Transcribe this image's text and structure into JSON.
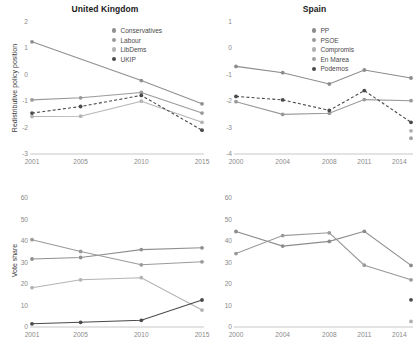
{
  "figure": {
    "panels": [
      "uk_policy",
      "spain_policy",
      "uk_vote",
      "spain_vote"
    ]
  },
  "uk_policy": {
    "title": "United Kingdom",
    "ylabel": "Redistributive policy position",
    "yticks": [
      "2",
      "1",
      "0",
      "-1",
      "-2",
      "-3"
    ],
    "xticks": [
      "2001",
      "2005",
      "2010",
      "2015"
    ],
    "legend": [
      {
        "label": "Conservatives",
        "color": "#909090"
      },
      {
        "label": "Labour",
        "color": "#9a9a9a"
      },
      {
        "label": "LibDems",
        "color": "#b4b4b4"
      },
      {
        "label": "UKIP",
        "color": "#4a4a4a"
      }
    ]
  },
  "spain_policy": {
    "title": "Spain",
    "ylabel": "",
    "yticks": [
      "1",
      "0",
      "-1",
      "-2",
      "-3",
      "-4"
    ],
    "xticks": [
      "2000",
      "2004",
      "2008",
      "2011",
      "2014"
    ],
    "legend": [
      {
        "label": "PP",
        "color": "#8c8c8c"
      },
      {
        "label": "PSOE",
        "color": "#9a9a9a"
      },
      {
        "label": "Compromis",
        "color": "#b0b0b0"
      },
      {
        "label": "En Marea",
        "color": "#a0a0a0"
      },
      {
        "label": "Podemos",
        "color": "#4a4a4a"
      }
    ]
  },
  "uk_vote": {
    "title": "",
    "ylabel": "Vote share",
    "yticks": [
      "60",
      "50",
      "40",
      "30",
      "20",
      "10",
      "0"
    ],
    "xticks": [
      "2001",
      "2005",
      "2010",
      "2015"
    ]
  },
  "spain_vote": {
    "title": "",
    "ylabel": "",
    "yticks": [
      "60",
      "50",
      "40",
      "30",
      "20",
      "10",
      "0"
    ],
    "xticks": [
      "2000",
      "2004",
      "2008",
      "2011",
      "2014"
    ]
  },
  "chart_data": [
    {
      "type": "line",
      "id": "uk_policy",
      "title": "United Kingdom",
      "xlabel": "",
      "ylabel": "Redistributive policy position",
      "x": [
        2001,
        2005,
        2010,
        2015
      ],
      "xticklabels": [
        "2001",
        "2005",
        "2010",
        "2015"
      ],
      "ylim": [
        -3,
        2
      ],
      "yticks": [
        2,
        1,
        0,
        -1,
        -2,
        -3
      ],
      "grid": false,
      "legend_position": "top-right",
      "series": [
        {
          "name": "Conservatives",
          "color": "#909090",
          "style": "solid",
          "values": [
            1.25,
            null,
            -0.22,
            -1.1
          ]
        },
        {
          "name": "Labour",
          "color": "#9a9a9a",
          "style": "solid",
          "values": [
            -0.95,
            -0.87,
            -0.67,
            -1.45
          ]
        },
        {
          "name": "LibDems",
          "color": "#b4b4b4",
          "style": "solid",
          "values": [
            -1.58,
            -1.57,
            -1.0,
            -1.8
          ]
        },
        {
          "name": "UKIP",
          "color": "#4a4a4a",
          "style": "dashed",
          "values": [
            -1.45,
            -1.2,
            -0.78,
            -2.1
          ]
        }
      ]
    },
    {
      "type": "line",
      "id": "spain_policy",
      "title": "Spain",
      "xlabel": "",
      "ylabel": "",
      "x": [
        2000,
        2004,
        2008,
        2011,
        2014,
        2015
      ],
      "xticklabels": [
        "2000",
        "2004",
        "2008",
        "2011",
        "2014"
      ],
      "ylim": [
        -4,
        1
      ],
      "yticks": [
        1,
        0,
        -1,
        -2,
        -3,
        -4
      ],
      "grid": false,
      "legend_position": "top-right",
      "series": [
        {
          "name": "PP",
          "color": "#8c8c8c",
          "style": "solid",
          "values": [
            -0.68,
            -0.92,
            -1.35,
            -0.82,
            null,
            -1.12
          ]
        },
        {
          "name": "PSOE",
          "color": "#9a9a9a",
          "style": "solid",
          "values": [
            -2.02,
            -2.5,
            -2.46,
            -1.94,
            null,
            -1.98
          ]
        },
        {
          "name": "Compromis",
          "color": "#b0b0b0",
          "style": "solid",
          "values": [
            null,
            null,
            null,
            null,
            null,
            -3.12
          ]
        },
        {
          "name": "En Marea",
          "color": "#a0a0a0",
          "style": "solid",
          "values": [
            null,
            null,
            null,
            null,
            null,
            -3.4
          ]
        },
        {
          "name": "Podemos",
          "color": "#4a4a4a",
          "style": "dashed",
          "values": [
            -1.82,
            -1.95,
            -2.35,
            -1.6,
            null,
            -2.8
          ]
        }
      ]
    },
    {
      "type": "line",
      "id": "uk_vote",
      "title": "",
      "xlabel": "",
      "ylabel": "Vote share",
      "x": [
        2001,
        2005,
        2010,
        2015
      ],
      "xticklabels": [
        "2001",
        "2005",
        "2010",
        "2015"
      ],
      "ylim": [
        0,
        62
      ],
      "yticks": [
        0,
        10,
        20,
        30,
        40,
        50,
        60
      ],
      "grid": false,
      "legend_position": "none",
      "series": [
        {
          "name": "Conservatives",
          "color": "#909090",
          "style": "solid",
          "values": [
            31.7,
            32.4,
            36.1,
            36.9
          ]
        },
        {
          "name": "Labour",
          "color": "#9a9a9a",
          "style": "solid",
          "values": [
            40.7,
            35.2,
            29.0,
            30.4
          ]
        },
        {
          "name": "LibDems",
          "color": "#b4b4b4",
          "style": "solid",
          "values": [
            18.3,
            22.0,
            23.0,
            7.9
          ]
        },
        {
          "name": "UKIP",
          "color": "#4a4a4a",
          "style": "solid",
          "values": [
            1.5,
            2.2,
            3.1,
            12.6
          ]
        }
      ]
    },
    {
      "type": "line",
      "id": "spain_vote",
      "title": "",
      "xlabel": "",
      "ylabel": "",
      "x": [
        2000,
        2004,
        2008,
        2011,
        2014,
        2015
      ],
      "xticklabels": [
        "2000",
        "2004",
        "2008",
        "2011",
        "2014"
      ],
      "ylim": [
        0,
        62
      ],
      "yticks": [
        0,
        10,
        20,
        30,
        40,
        50,
        60
      ],
      "grid": false,
      "legend_position": "none",
      "series": [
        {
          "name": "PP",
          "color": "#8c8c8c",
          "style": "solid",
          "values": [
            44.5,
            37.7,
            39.9,
            44.6,
            null,
            28.7
          ]
        },
        {
          "name": "PSOE",
          "color": "#9a9a9a",
          "style": "solid",
          "values": [
            34.2,
            42.6,
            43.9,
            28.8,
            null,
            22.0
          ]
        },
        {
          "name": "Podemos",
          "color": "#4a4a4a",
          "style": "solid",
          "values": [
            null,
            null,
            null,
            null,
            null,
            12.7
          ]
        },
        {
          "name": "Compromis",
          "color": "#b0b0b0",
          "style": "solid",
          "values": [
            null,
            null,
            null,
            null,
            null,
            2.6
          ]
        }
      ]
    }
  ]
}
